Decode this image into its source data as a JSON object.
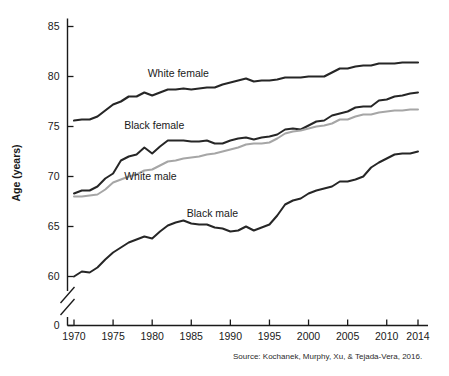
{
  "chart_data": {
    "type": "line",
    "title": "",
    "xlabel": "",
    "ylabel": "Age (years)",
    "xlim": [
      1970,
      2014
    ],
    "ylim": [
      0,
      85
    ],
    "y_axis_break": true,
    "y_axis_break_note": "axis broken between 0 and 60",
    "grid": false,
    "legend": "inline-labels",
    "xticks": [
      "1970",
      "1975",
      "1980",
      "1985",
      "1990",
      "1995",
      "2000",
      "2005",
      "2010",
      "2014"
    ],
    "yticks": [
      "0",
      "60",
      "65",
      "70",
      "75",
      "80",
      "85"
    ],
    "x": [
      1970,
      1971,
      1972,
      1973,
      1974,
      1975,
      1976,
      1977,
      1978,
      1979,
      1980,
      1981,
      1982,
      1983,
      1984,
      1985,
      1986,
      1987,
      1988,
      1989,
      1990,
      1991,
      1992,
      1993,
      1994,
      1995,
      1996,
      1997,
      1998,
      1999,
      2000,
      2001,
      2002,
      2003,
      2004,
      2005,
      2006,
      2007,
      2008,
      2009,
      2010,
      2011,
      2012,
      2013,
      2014
    ],
    "series": [
      {
        "name": "White female",
        "color": "#262626",
        "width": 2.2,
        "label_x": 1983,
        "label_y": 80.3,
        "values": [
          75.6,
          75.7,
          75.7,
          76.0,
          76.6,
          77.2,
          77.5,
          78.0,
          78.0,
          78.4,
          78.1,
          78.4,
          78.7,
          78.7,
          78.8,
          78.7,
          78.8,
          78.9,
          78.9,
          79.2,
          79.4,
          79.6,
          79.8,
          79.5,
          79.6,
          79.6,
          79.7,
          79.9,
          79.9,
          79.9,
          80.0,
          80.0,
          80.0,
          80.4,
          80.8,
          80.8,
          81.0,
          81.1,
          81.1,
          81.3,
          81.3,
          81.3,
          81.4,
          81.4,
          81.4
        ]
      },
      {
        "name": "Black female",
        "color": "#262626",
        "width": 2.0,
        "label_x": 1980,
        "label_y": 75.1,
        "values": [
          68.3,
          68.6,
          68.6,
          69.0,
          69.8,
          70.3,
          71.6,
          72.0,
          72.2,
          72.9,
          72.3,
          73.0,
          73.6,
          73.6,
          73.6,
          73.5,
          73.5,
          73.6,
          73.3,
          73.3,
          73.6,
          73.8,
          73.9,
          73.7,
          73.9,
          74.0,
          74.2,
          74.7,
          74.8,
          74.7,
          75.1,
          75.5,
          75.6,
          76.1,
          76.3,
          76.5,
          76.9,
          77.0,
          77.0,
          77.6,
          77.7,
          78.0,
          78.1,
          78.3,
          78.4
        ]
      },
      {
        "name": "White male",
        "color": "#a6a6a6",
        "width": 2.0,
        "label_x": 1980,
        "label_y": 70.0,
        "values": [
          68.0,
          68.0,
          68.1,
          68.2,
          68.7,
          69.4,
          69.7,
          70.0,
          70.2,
          70.6,
          70.7,
          71.1,
          71.5,
          71.6,
          71.8,
          71.9,
          72.0,
          72.2,
          72.3,
          72.5,
          72.7,
          72.9,
          73.2,
          73.3,
          73.3,
          73.4,
          73.8,
          74.3,
          74.5,
          74.6,
          74.8,
          75.0,
          75.1,
          75.3,
          75.7,
          75.7,
          76.0,
          76.2,
          76.2,
          76.4,
          76.5,
          76.6,
          76.6,
          76.7,
          76.7
        ]
      },
      {
        "name": "Black male",
        "color": "#262626",
        "width": 2.0,
        "label_x": 1988,
        "label_y": 66.3,
        "values": [
          60.0,
          60.5,
          60.4,
          60.9,
          61.7,
          62.4,
          62.9,
          63.4,
          63.7,
          64.0,
          63.8,
          64.5,
          65.1,
          65.4,
          65.6,
          65.3,
          65.2,
          65.2,
          64.9,
          64.8,
          64.5,
          64.6,
          65.0,
          64.6,
          64.9,
          65.2,
          66.1,
          67.2,
          67.6,
          67.8,
          68.3,
          68.6,
          68.8,
          69.0,
          69.5,
          69.5,
          69.7,
          70.0,
          70.9,
          71.4,
          71.8,
          72.2,
          72.3,
          72.3,
          72.5
        ]
      }
    ],
    "source": "Source: Kochanek, Murphy, Xu, & Tejada-Vera, 2016."
  },
  "axis": {
    "y_title": "Age (years)",
    "yticks": [
      {
        "label": "85",
        "value": 85
      },
      {
        "label": "80",
        "value": 80
      },
      {
        "label": "75",
        "value": 75
      },
      {
        "label": "70",
        "value": 70
      },
      {
        "label": "65",
        "value": 65
      },
      {
        "label": "60",
        "value": 60
      },
      {
        "label": "0",
        "value": 0
      }
    ],
    "xticks": [
      {
        "label": "1970",
        "value": 1970
      },
      {
        "label": "1975",
        "value": 1975
      },
      {
        "label": "1980",
        "value": 1980
      },
      {
        "label": "1985",
        "value": 1985
      },
      {
        "label": "1990",
        "value": 1990
      },
      {
        "label": "1995",
        "value": 1995
      },
      {
        "label": "2000",
        "value": 2000
      },
      {
        "label": "2005",
        "value": 2005
      },
      {
        "label": "2010",
        "value": 2010
      },
      {
        "label": "2014",
        "value": 2014
      }
    ]
  },
  "labels": {
    "white_female": "White female",
    "black_female": "Black female",
    "white_male": "White male",
    "black_male": "Black male"
  },
  "source_note": "Source: Kochanek, Murphy, Xu, & Tejada-Vera, 2016."
}
